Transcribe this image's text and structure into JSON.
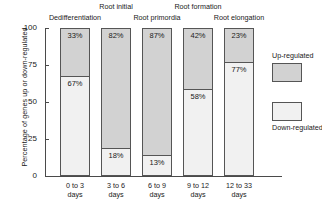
{
  "chart_data": {
    "type": "bar",
    "subtype": "stacked-percentage",
    "title": "",
    "xlabel": "",
    "ylabel": "Percentage of genes up or down-regulated",
    "ylim": [
      0,
      100
    ],
    "yticks": [
      0,
      25,
      50,
      75,
      100
    ],
    "ytick_labels": [
      "0",
      "25",
      "50",
      "75",
      "100"
    ],
    "grid": false,
    "legend_position": "right",
    "categories": [
      "0 to 3 days",
      "3 to 6 days",
      "6 to 9 days",
      "9 to 12 days",
      "12 to 33 days"
    ],
    "category_lines": [
      [
        "0 to 3",
        "days"
      ],
      [
        "3 to 6",
        "days"
      ],
      [
        "6 to 9",
        "days"
      ],
      [
        "9 to 12",
        "days"
      ],
      [
        "12 to 33",
        "days"
      ]
    ],
    "series": [
      {
        "name": "Up-regulated",
        "color": "#d2d2d2",
        "values": [
          33,
          82,
          87,
          42,
          23
        ],
        "labels": [
          "33%",
          "82%",
          "87%",
          "42%",
          "23%"
        ]
      },
      {
        "name": "Down-regulated",
        "color": "#f1f1f1",
        "values": [
          67,
          18,
          13,
          58,
          77
        ],
        "labels": [
          "67%",
          "18%",
          "13%",
          "58%",
          "77%"
        ]
      }
    ],
    "annotations": [
      {
        "text": "Dedifferentiation",
        "row": "lower",
        "category_index": 0
      },
      {
        "text": "Root initial",
        "row": "upper",
        "category_index": 1
      },
      {
        "text": "Root primordia",
        "row": "lower",
        "category_index": 2
      },
      {
        "text": "Root formation",
        "row": "upper",
        "category_index": 3
      },
      {
        "text": "Root elongation",
        "row": "lower",
        "category_index": 4
      }
    ]
  },
  "legend": {
    "up_label": "Up-regulated",
    "down_label": "Down-regulated"
  },
  "colors": {
    "up_regulated": "#d2d2d2",
    "down_regulated": "#f1f1f1",
    "outline": "#555555",
    "axis": "#4a4a4a",
    "text": "#1a1a1a",
    "background": "#ffffff"
  }
}
